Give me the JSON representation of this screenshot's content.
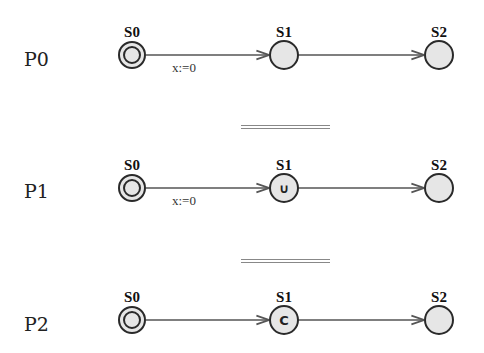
{
  "diagram": {
    "type": "timed-automata",
    "rows": [
      {
        "process": "P0",
        "states": [
          {
            "name": "S0",
            "initial": true,
            "marker": ""
          },
          {
            "name": "S1",
            "initial": false,
            "marker": ""
          },
          {
            "name": "S2",
            "initial": false,
            "marker": ""
          }
        ],
        "edges": [
          {
            "from": "S0",
            "to": "S1",
            "label": "x:=0"
          },
          {
            "from": "S1",
            "to": "S2",
            "label": ""
          }
        ]
      },
      {
        "process": "P1",
        "states": [
          {
            "name": "S0",
            "initial": true,
            "marker": ""
          },
          {
            "name": "S1",
            "initial": false,
            "marker": "∪"
          },
          {
            "name": "S2",
            "initial": false,
            "marker": ""
          }
        ],
        "edges": [
          {
            "from": "S0",
            "to": "S1",
            "label": "x:=0"
          },
          {
            "from": "S1",
            "to": "S2",
            "label": ""
          }
        ]
      },
      {
        "process": "P2",
        "states": [
          {
            "name": "S0",
            "initial": true,
            "marker": ""
          },
          {
            "name": "S1",
            "initial": false,
            "marker": "C"
          },
          {
            "name": "S2",
            "initial": false,
            "marker": ""
          }
        ],
        "edges": [
          {
            "from": "S0",
            "to": "S1",
            "label": ""
          },
          {
            "from": "S1",
            "to": "S2",
            "label": ""
          }
        ]
      }
    ],
    "separators": [
      "equivalence",
      "equivalence"
    ]
  }
}
